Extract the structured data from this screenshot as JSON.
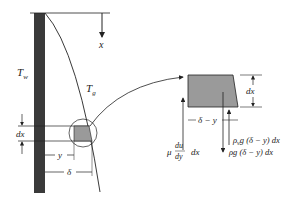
{
  "diagram": {
    "type": "film-condensation-on-vertical-wall",
    "labels": {
      "x_axis": "x",
      "wall_temperature": "T",
      "wall_temperature_sub": "w",
      "saturation_temperature": "T",
      "saturation_temperature_sub": "g",
      "dx_left": "dx",
      "y_left": "y",
      "delta_left": "δ",
      "dx_right": "dx",
      "delta_minus_y": "δ − y",
      "shear_mu": "μ",
      "shear_du": "du",
      "shear_dy": "dy",
      "shear_dx": "dx",
      "vapor_force": "ρ",
      "vapor_force_sub": "v",
      "vapor_force_rest": "g (δ − y) dx",
      "gravity_force": "ρg (δ − y) dx"
    },
    "colors": {
      "wall": "#3a3a3a",
      "element_fill": "#9a9a9a",
      "line": "#222222"
    }
  }
}
